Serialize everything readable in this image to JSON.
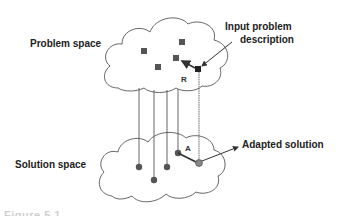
{
  "diagram": {
    "labels": {
      "problem_space": "Problem space",
      "solution_space": "Solution space",
      "input_line1": "Input problem",
      "input_line2": "description",
      "adapted_solution": "Adapted solution",
      "retrieve": "R",
      "adapt": "A"
    },
    "caption": "Figure 5.1",
    "colors": {
      "square": "#555555",
      "input_square": "#222222",
      "dot": "#555555",
      "adapted_dot": "#888888",
      "line": "#555555",
      "text": "#222222"
    },
    "problem_cases": [
      {
        "id": "p1",
        "x": 144,
        "y": 51
      },
      {
        "id": "p2",
        "x": 182,
        "y": 42
      },
      {
        "id": "p3",
        "x": 158,
        "y": 67
      },
      {
        "id": "p4",
        "x": 176,
        "y": 58
      }
    ],
    "input_problem": {
      "x": 198,
      "y": 69
    },
    "solution_cases": [
      {
        "id": "s1",
        "x": 139,
        "y": 167
      },
      {
        "id": "s2",
        "x": 154,
        "y": 180
      },
      {
        "id": "s3",
        "x": 167,
        "y": 167
      },
      {
        "id": "s4",
        "x": 178,
        "y": 153
      }
    ],
    "adapted": {
      "x": 199,
      "y": 163
    }
  }
}
